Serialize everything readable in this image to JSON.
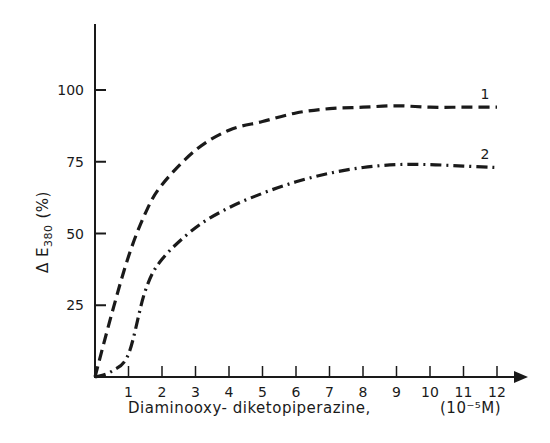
{
  "chart_data": {
    "type": "line",
    "title": "",
    "xlabel": "Diaminooxy- diketopiperazine,",
    "xunit": "(10⁻⁵M)",
    "ylabel": "Δ E",
    "ylabel_subscript": "380",
    "ylabel_unit": "(%)",
    "xlim": [
      0,
      12
    ],
    "ylim": [
      0,
      120
    ],
    "x_ticks": [
      "1",
      "2",
      "3",
      "4",
      "5",
      "6",
      "7",
      "8",
      "9",
      "10",
      "11",
      "12"
    ],
    "y_ticks": [
      "25",
      "50",
      "75",
      "100"
    ],
    "grid": false,
    "legend": "inline curve labels",
    "x": [
      0,
      0.5,
      1,
      1.5,
      2,
      3,
      4,
      5,
      6,
      7,
      8,
      9,
      10,
      11,
      12
    ],
    "series": [
      {
        "name": "1",
        "style": "dashed",
        "values": [
          0,
          22,
          42,
          57,
          67,
          79,
          86,
          89,
          92,
          93.5,
          94,
          94.5,
          94,
          94,
          94
        ]
      },
      {
        "name": "2",
        "style": "dash-dot",
        "values": [
          0,
          2,
          8,
          30,
          41,
          52,
          59,
          64,
          68,
          71,
          73,
          74,
          74,
          73.5,
          73
        ]
      }
    ]
  },
  "colors": {
    "ink": "#1a1a1a",
    "background": "#ffffff"
  }
}
